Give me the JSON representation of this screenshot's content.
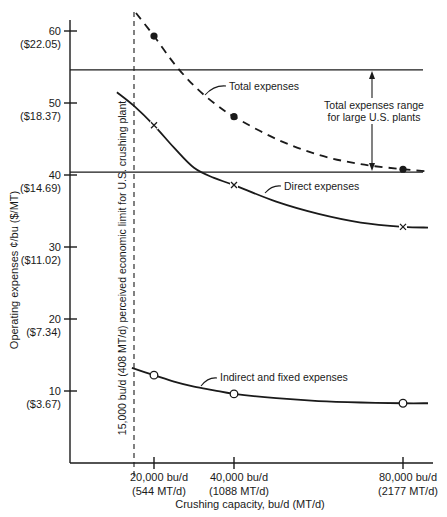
{
  "chart_data": {
    "type": "line",
    "title": "",
    "xlabel": "Crushing capacity, bu/d (MT/d)",
    "ylabel": "Operating expenses ¢/bu ($/MT)",
    "xlim": [
      0,
      86000
    ],
    "ylim": [
      0,
      64
    ],
    "grid": false,
    "y_ticks": [
      {
        "value": 60,
        "label": "60",
        "sublabel": "($22.05)"
      },
      {
        "value": 50,
        "label": "50",
        "sublabel": "($18.37)"
      },
      {
        "value": 40,
        "label": "40",
        "sublabel": "($14.69)"
      },
      {
        "value": 30,
        "label": "30",
        "sublabel": "($11.02)"
      },
      {
        "value": 20,
        "label": "20",
        "sublabel": "($7.34)"
      },
      {
        "value": 10,
        "label": "10",
        "sublabel": "($3.67)"
      }
    ],
    "x_ticks": [
      {
        "value": 20000,
        "label": "20,000 bu/d",
        "sublabel": "(544 MT/d)"
      },
      {
        "value": 40000,
        "label": "40,000 bu/d",
        "sublabel": "(1088 MT/d)"
      },
      {
        "value": 80000,
        "label": "80,000 bu/d",
        "sublabel": "(2177 MT/d)"
      }
    ],
    "series": [
      {
        "name": "Total expenses",
        "style": "dashed",
        "marker": "filled-circle",
        "curve_x": [
          15500,
          20000,
          25000,
          30000,
          35000,
          40000,
          50000,
          60000,
          70000,
          80000,
          85000
        ],
        "curve_y": [
          62.5,
          59.3,
          55.5,
          52.4,
          50.0,
          48.1,
          45.0,
          42.8,
          41.5,
          40.8,
          40.5
        ],
        "points": [
          {
            "x": 20000,
            "y": 59.3
          },
          {
            "x": 40000,
            "y": 48.1
          },
          {
            "x": 80000,
            "y": 40.8
          }
        ]
      },
      {
        "name": "Direct expenses",
        "style": "solid",
        "marker": "x",
        "curve_x": [
          11000,
          15000,
          20000,
          25000,
          30000,
          35000,
          40000,
          50000,
          60000,
          70000,
          80000,
          85000
        ],
        "curve_y": [
          51.5,
          49.6,
          46.9,
          43.8,
          41.0,
          39.6,
          38.6,
          36.3,
          34.6,
          33.4,
          32.8,
          32.7
        ],
        "points": [
          {
            "x": 20000,
            "y": 46.9
          },
          {
            "x": 40000,
            "y": 38.6
          },
          {
            "x": 80000,
            "y": 32.8
          }
        ]
      },
      {
        "name": "Indirect and fixed expenses",
        "style": "solid",
        "marker": "open-circle",
        "curve_x": [
          14500,
          20000,
          25000,
          30000,
          35000,
          40000,
          50000,
          60000,
          70000,
          80000,
          85000
        ],
        "curve_y": [
          13.2,
          12.2,
          11.3,
          10.6,
          10.1,
          9.6,
          9.0,
          8.6,
          8.4,
          8.3,
          8.3
        ],
        "points": [
          {
            "x": 20000,
            "y": 12.2
          },
          {
            "x": 40000,
            "y": 9.6
          },
          {
            "x": 80000,
            "y": 8.3
          }
        ]
      }
    ],
    "reference_lines": {
      "horizontal": [
        54.6,
        40.4
      ],
      "vertical_limit": {
        "x": 15000,
        "label": "15,000 bu/d (408 MT/d) perceived economic limit for U.S. crushing plant"
      }
    },
    "annotations": [
      {
        "text": "Total expenses",
        "target_series": "Total expenses"
      },
      {
        "text": "Direct expenses",
        "target_series": "Direct expenses"
      },
      {
        "text": "Indirect and fixed expenses",
        "target_series": "Indirect and fixed expenses"
      },
      {
        "text_lines": [
          "Total expenses range",
          "for large U.S. plants"
        ],
        "spans": [
          40.4,
          54.6
        ]
      }
    ]
  }
}
